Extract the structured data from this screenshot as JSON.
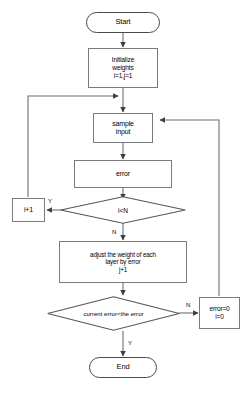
{
  "diagram": {
    "type": "flowchart",
    "stroke_color": "#7a7a7a",
    "line_color": "#6e6e6e",
    "text_color": "#000000",
    "background": "#ffffff"
  },
  "nodes": {
    "start": {
      "label": "Start",
      "shape": "terminator"
    },
    "initialize": {
      "label": "Initialize\nweights\ni=1,j=1",
      "shape": "process"
    },
    "sample_input": {
      "label": "sample\ninput",
      "shape": "process"
    },
    "error": {
      "label": "error",
      "shape": "process"
    },
    "decision_i_lt_n": {
      "label": "i<N",
      "shape": "decision"
    },
    "increment_i": {
      "label": "i+1",
      "shape": "process"
    },
    "adjust_weights": {
      "label": "adjust the weight of each\nlayer by error\nj+1",
      "shape": "process"
    },
    "decision_current_error": {
      "label": "current error<the error",
      "shape": "decision"
    },
    "reset_error": {
      "label": "error=0\ni=0",
      "shape": "process"
    },
    "end": {
      "label": "End",
      "shape": "terminator"
    }
  },
  "edge_labels": {
    "i_lt_n_yes": "Y",
    "i_lt_n_no": "N",
    "current_error_no": "N",
    "current_error_yes": "Y"
  }
}
